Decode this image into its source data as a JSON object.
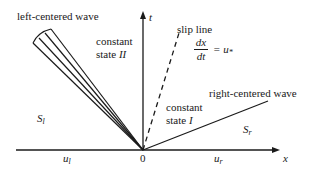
{
  "diagram": {
    "type": "characteristics x-t diagram (Riemann problem)",
    "axes": {
      "x_label": "x",
      "t_label": "t",
      "origin_label": "0"
    },
    "labels": {
      "left_wave": "left-centered wave",
      "right_wave": "right-centered wave",
      "slip_line": "slip line",
      "state_II_word": "constant",
      "state_II_line2": "state ",
      "state_II_roman": "II",
      "state_I_word": "constant",
      "state_I_line2": "state ",
      "state_I_roman": "I",
      "S_left": "S",
      "S_left_sub": "l",
      "S_right": "S",
      "S_right_sub": "r",
      "u_left": "u",
      "u_left_sub": "l",
      "u_right": "u",
      "u_right_sub": "r",
      "slip_eq_num": "dx",
      "slip_eq_den": "dt",
      "slip_eq_rhs": "= u",
      "slip_eq_rhs_sub": "*"
    },
    "colors": {
      "ink": "#1a1a1a",
      "background": "#ffffff"
    }
  }
}
